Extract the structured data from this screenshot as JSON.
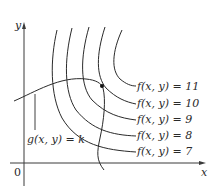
{
  "figure": {
    "axes": {
      "x_label": "x",
      "y_label": "y",
      "origin_label": "0"
    },
    "constraint_label": "g(x, y) = k",
    "level_curve_labels": [
      "f(x, y) = 11",
      "f(x, y) = 10",
      "f(x, y) = 9",
      "f(x, y) = 8",
      "f(x, y) = 7"
    ],
    "tangent_point": {
      "description": "point of tangency between g(x, y) = k and f(x, y) = 10"
    },
    "colors": {
      "line": "#2a2a2a",
      "background": "#ffffff"
    }
  }
}
